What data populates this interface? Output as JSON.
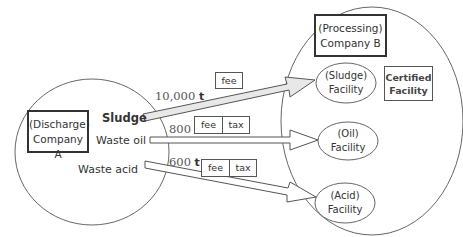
{
  "discharger": {
    "role": "(Discharge)",
    "name": "Company A"
  },
  "processor": {
    "role": "(Processing)",
    "name": "Company B"
  },
  "certified_label": {
    "line1": "Certified",
    "line2": "Facility"
  },
  "flows": [
    {
      "waste": "Sludge",
      "quantity": "10,000",
      "unit": "t",
      "charges": [
        "fee"
      ],
      "facility": {
        "type": "(Sludge)",
        "label": "Facility"
      },
      "arrow_fill": "#e8e8e8"
    },
    {
      "waste": "Waste oil",
      "quantity": "800",
      "unit": "t",
      "charges": [
        "fee",
        "tax"
      ],
      "facility": {
        "type": "(Oil)",
        "label": "Facility"
      },
      "arrow_fill": "#ffffff"
    },
    {
      "waste": "Waste acid",
      "quantity": "600",
      "unit": "t",
      "charges": [
        "fee",
        "tax"
      ],
      "facility": {
        "type": "(Acid)",
        "label": "Facility"
      },
      "arrow_fill": "#ffffff"
    }
  ],
  "colors": {
    "line": "#555555",
    "sludge_arrow": "#e8e8e8",
    "background": "#ffffff"
  }
}
